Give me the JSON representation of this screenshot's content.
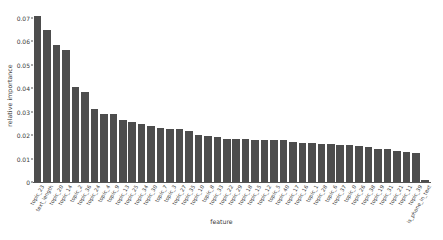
{
  "chart_data": {
    "type": "bar",
    "title": "",
    "xlabel": "feature",
    "ylabel": "relative importance",
    "ylim": [
      0,
      0.0725
    ],
    "yticks": [
      0,
      0.01,
      0.02,
      0.03,
      0.04,
      0.05,
      0.06,
      0.07
    ],
    "ytick_labels": [
      "0",
      "0.01",
      "0.02",
      "0.03",
      "0.04",
      "0.05",
      "0.06",
      "0.07"
    ],
    "grid": false,
    "legend": null,
    "bar_color": "#4d4d4d",
    "categories": [
      "topic_23",
      "text_length",
      "topic_20",
      "topic_14",
      "topic_2",
      "topic_36",
      "topic_24",
      "topic_4",
      "topic_9",
      "topic_13",
      "topic_25",
      "topic_34",
      "topic_30",
      "topic_7",
      "topic_3",
      "topic_27",
      "topic_35",
      "topic_10",
      "topic_8",
      "topic_33",
      "topic_22",
      "topic_29",
      "topic_18",
      "topic_15",
      "topic_12",
      "topic_5",
      "topic_40",
      "topic_17",
      "topic_16",
      "topic_1",
      "topic_28",
      "topic_6",
      "topic_37",
      "topic_0",
      "topic_26",
      "topic_38",
      "topic_19",
      "topic_31",
      "topic_21",
      "topic_11",
      "topic_39",
      "is_phone_in_text"
    ],
    "values": [
      0.071,
      0.0648,
      0.0583,
      0.0561,
      0.0406,
      0.0385,
      0.0311,
      0.0291,
      0.0288,
      0.0266,
      0.0258,
      0.0246,
      0.0241,
      0.0231,
      0.0228,
      0.0226,
      0.0216,
      0.02,
      0.0196,
      0.019,
      0.0185,
      0.0183,
      0.0182,
      0.0181,
      0.018,
      0.0179,
      0.0178,
      0.0171,
      0.0167,
      0.0165,
      0.0162,
      0.0161,
      0.0159,
      0.0156,
      0.0154,
      0.015,
      0.0142,
      0.014,
      0.0133,
      0.0126,
      0.0124,
      0.0008
    ]
  }
}
